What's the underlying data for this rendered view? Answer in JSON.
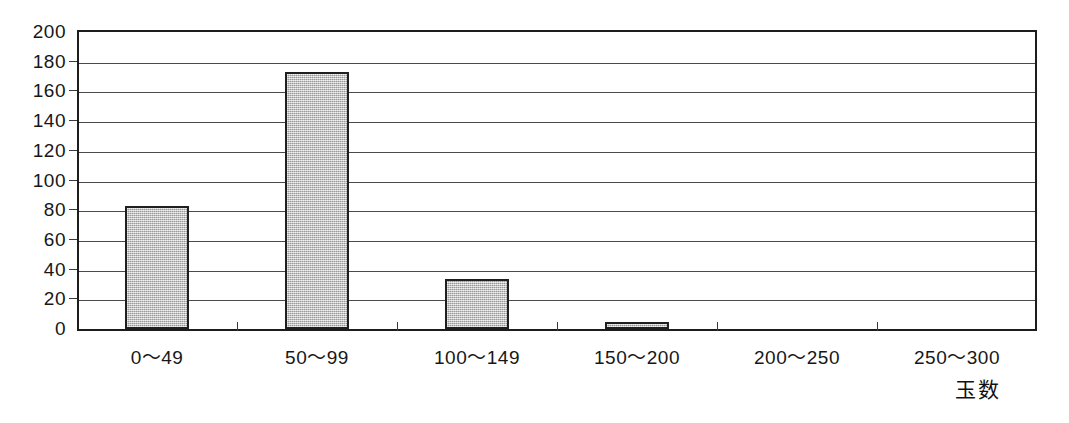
{
  "chart_data": {
    "type": "bar",
    "title": "",
    "subtitle": "",
    "xlabel": "玉数",
    "ylabel": "",
    "categories": [
      "0〜49",
      "50〜99",
      "100〜149",
      "150〜200",
      "200〜250",
      "250〜300"
    ],
    "values": [
      83,
      173,
      34,
      5,
      0,
      0
    ],
    "series": [
      {
        "name": "",
        "values": [
          83,
          173,
          34,
          5,
          0,
          0
        ]
      }
    ],
    "ylim": [
      0,
      200
    ],
    "y_ticks": [
      200,
      180,
      160,
      140,
      120,
      100,
      80,
      60,
      40,
      20,
      0
    ],
    "y_tick_labels": [
      "200",
      "180",
      "160",
      "140",
      "120",
      "100",
      "80",
      "60",
      "40",
      "20",
      "0"
    ],
    "grid": true,
    "grid_axis": "y",
    "legend": false,
    "legend_position": "none",
    "bar_fill_color": "#bdbdbd",
    "bar_border_color": "#1f1f1f",
    "axis_color": "#1d1d1d",
    "gridline_color": "#4a4a4a",
    "background_color": "#ffffff",
    "annotations": []
  },
  "axis": {
    "x_title": "玉数"
  }
}
